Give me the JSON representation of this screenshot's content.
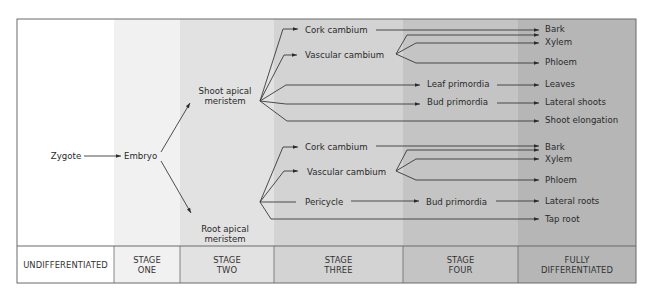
{
  "frame": {
    "x": 17,
    "y": 19,
    "w": 619,
    "h": 264,
    "divider_y": 246,
    "border": "#6a6a6a"
  },
  "columns": [
    {
      "x0": 17,
      "x1": 114,
      "fill": "#ffffff",
      "label": [
        "UNDIFFERENTIATED"
      ]
    },
    {
      "x0": 114,
      "x1": 180,
      "fill": "#f1f1f1",
      "label": [
        "STAGE",
        "ONE"
      ]
    },
    {
      "x0": 180,
      "x1": 274,
      "fill": "#e2e2e2",
      "label": [
        "STAGE",
        "TWO"
      ]
    },
    {
      "x0": 274,
      "x1": 403,
      "fill": "#d3d3d3",
      "label": [
        "STAGE",
        "THREE"
      ]
    },
    {
      "x0": 403,
      "x1": 518,
      "fill": "#c4c4c4",
      "label": [
        "STAGE",
        "FOUR"
      ]
    },
    {
      "x0": 518,
      "x1": 636,
      "fill": "#b6b6b6",
      "label": [
        "FULLY",
        "DIFFERENTIATED"
      ]
    }
  ],
  "nodes": [
    {
      "id": "zygote",
      "text": [
        "Zygote"
      ],
      "x": 66,
      "y": 159,
      "anchor": "middle"
    },
    {
      "id": "embryo",
      "text": [
        "Embryo"
      ],
      "x": 124,
      "y": 159,
      "anchor": "start"
    },
    {
      "id": "shoot-apical-meristem",
      "text": [
        "Shoot apical",
        "meristem"
      ],
      "x": 225,
      "y": 99,
      "anchor": "middle"
    },
    {
      "id": "root-apical-meristem",
      "text": [
        "Root apical",
        "meristem"
      ],
      "x": 225,
      "y": 237,
      "anchor": "middle"
    },
    {
      "id": "shoot-cork-cambium",
      "text": [
        "Cork cambium"
      ],
      "x": 305,
      "y": 33,
      "anchor": "start"
    },
    {
      "id": "shoot-vascular-cambium",
      "text": [
        "Vascular cambium"
      ],
      "x": 305,
      "y": 58,
      "anchor": "start"
    },
    {
      "id": "leaf-primordia",
      "text": [
        "Leaf primordia"
      ],
      "x": 427,
      "y": 87,
      "anchor": "start"
    },
    {
      "id": "shoot-bud-primordia",
      "text": [
        "Bud primordia"
      ],
      "x": 427,
      "y": 105,
      "anchor": "start"
    },
    {
      "id": "shoot-bark",
      "text": [
        "Bark"
      ],
      "x": 545,
      "y": 32,
      "anchor": "start"
    },
    {
      "id": "shoot-xylem",
      "text": [
        "Xylem"
      ],
      "x": 545,
      "y": 45,
      "anchor": "start"
    },
    {
      "id": "shoot-phloem",
      "text": [
        "Phloem"
      ],
      "x": 545,
      "y": 65,
      "anchor": "start"
    },
    {
      "id": "leaves",
      "text": [
        "Leaves"
      ],
      "x": 545,
      "y": 87,
      "anchor": "start"
    },
    {
      "id": "lateral-shoots",
      "text": [
        "Lateral shoots"
      ],
      "x": 545,
      "y": 105,
      "anchor": "start"
    },
    {
      "id": "shoot-elongation",
      "text": [
        "Shoot elongation"
      ],
      "x": 545,
      "y": 123,
      "anchor": "start"
    },
    {
      "id": "root-cork-cambium",
      "text": [
        "Cork cambium"
      ],
      "x": 305,
      "y": 150,
      "anchor": "start"
    },
    {
      "id": "root-vascular-cambium",
      "text": [
        "Vascular cambium"
      ],
      "x": 307,
      "y": 175,
      "anchor": "start"
    },
    {
      "id": "pericycle",
      "text": [
        "Pericycle"
      ],
      "x": 305,
      "y": 205,
      "anchor": "start"
    },
    {
      "id": "root-bud-primordia",
      "text": [
        "Bud primordia"
      ],
      "x": 426,
      "y": 205,
      "anchor": "start"
    },
    {
      "id": "root-bark",
      "text": [
        "Bark"
      ],
      "x": 545,
      "y": 150,
      "anchor": "start"
    },
    {
      "id": "root-xylem",
      "text": [
        "Xylem"
      ],
      "x": 545,
      "y": 162,
      "anchor": "start"
    },
    {
      "id": "root-phloem",
      "text": [
        "Phloem"
      ],
      "x": 545,
      "y": 183,
      "anchor": "start"
    },
    {
      "id": "lateral-roots",
      "text": [
        "Lateral roots"
      ],
      "x": 545,
      "y": 204,
      "anchor": "start"
    },
    {
      "id": "tap-root",
      "text": [
        "Tap root"
      ],
      "x": 545,
      "y": 222,
      "anchor": "start"
    }
  ],
  "edges": [
    {
      "name": "zygote-to-embryo",
      "d": "M84 156 L121 156",
      "arrow": [
        121,
        156,
        0
      ]
    },
    {
      "name": "embryo-to-shoot",
      "d": "M161 152 L190 103",
      "arrow": [
        190,
        103,
        -59
      ]
    },
    {
      "name": "embryo-to-root",
      "d": "M161 161 L191 213",
      "arrow": [
        191,
        213,
        60
      ]
    },
    {
      "name": "shoot-to-cork",
      "d": "M260 101 L283 29 L298 29",
      "arrow": [
        298,
        29,
        0
      ]
    },
    {
      "name": "shoot-to-vascular",
      "d": "M260 101 L284 55 L297 55",
      "arrow": [
        297,
        55,
        0
      ]
    },
    {
      "name": "shoot-to-leaf-primordia",
      "d": "M260 101 L286 85 L420 85",
      "arrow": [
        420,
        85,
        0
      ]
    },
    {
      "name": "shoot-to-bud-primordia",
      "d": "M260 101 L286 104 L420 104",
      "arrow": [
        420,
        104,
        0
      ]
    },
    {
      "name": "shoot-to-elongation",
      "d": "M260 101 L287 121 L539 121",
      "arrow": [
        539,
        121,
        0
      ]
    },
    {
      "name": "shoot-cork-to-bark",
      "d": "M376 30 L539 30",
      "arrow": [
        539,
        30,
        0
      ]
    },
    {
      "name": "shoot-vascular-to-bark",
      "d": "M396 54 L407 35 L539 35",
      "arrow": [
        539,
        35,
        0
      ]
    },
    {
      "name": "shoot-vascular-to-xylem",
      "d": "M396 54 L416 43 L539 43",
      "arrow": [
        539,
        43,
        0
      ]
    },
    {
      "name": "shoot-vascular-to-phloem",
      "d": "M396 54 L416 63 L539 63",
      "arrow": [
        539,
        63,
        0
      ]
    },
    {
      "name": "leaf-to-leaves",
      "d": "M497 85 L539 85",
      "arrow": [
        539,
        85,
        0
      ]
    },
    {
      "name": "bud-to-lateral-shoots",
      "d": "M497 103 L539 103",
      "arrow": [
        539,
        103,
        0
      ]
    },
    {
      "name": "root-to-cork",
      "d": "M260 202 L283 147 L298 147",
      "arrow": [
        298,
        147,
        0
      ]
    },
    {
      "name": "root-to-vascular",
      "d": "M260 202 L284 171 L298 171",
      "arrow": [
        298,
        171,
        0
      ]
    },
    {
      "name": "root-to-pericycle",
      "d": "M260 202 L272 202 L296 202",
      "arrow": null
    },
    {
      "name": "root-to-tap-root",
      "d": "M260 202 L271 219 L539 219",
      "arrow": [
        539,
        219,
        0
      ]
    },
    {
      "name": "root-cork-to-bark",
      "d": "M376 146 L539 146",
      "arrow": [
        539,
        146,
        0
      ]
    },
    {
      "name": "root-vascular-to-bark",
      "d": "M396 171 L407 150 L539 150",
      "arrow": [
        539,
        150,
        0
      ]
    },
    {
      "name": "root-vascular-to-xylem",
      "d": "M396 171 L416 159 L539 159",
      "arrow": [
        539,
        159,
        0
      ]
    },
    {
      "name": "root-vascular-to-phloem",
      "d": "M396 171 L416 180 L539 180",
      "arrow": [
        539,
        180,
        0
      ]
    },
    {
      "name": "pericycle-to-bud",
      "d": "M351 201 L419 201",
      "arrow": [
        419,
        201,
        0
      ]
    },
    {
      "name": "bud-to-lateral-roots",
      "d": "M496 201 L539 201",
      "arrow": [
        539,
        201,
        0
      ]
    }
  ]
}
